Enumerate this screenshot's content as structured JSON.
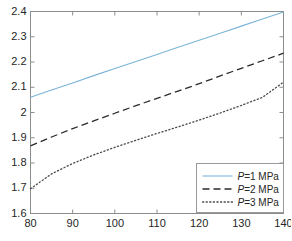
{
  "chart_data": {
    "type": "line",
    "title": "",
    "xlabel": "",
    "ylabel": "",
    "xlim": [
      80,
      140
    ],
    "ylim": [
      1.6,
      2.4
    ],
    "xticks": [
      80,
      90,
      100,
      110,
      120,
      130,
      140
    ],
    "yticks": [
      1.6,
      1.7,
      1.8,
      1.9,
      2.0,
      2.1,
      2.2,
      2.3,
      2.4
    ],
    "xtick_labels": [
      "80",
      "90",
      "100",
      "110",
      "120",
      "130",
      "140"
    ],
    "ytick_labels": [
      "1.6",
      "1.7",
      "1.8",
      "1.9",
      "2",
      "2.1",
      "2.2",
      "2.3",
      "2.4"
    ],
    "grid": false,
    "legend_position": "lower right",
    "box": true,
    "tick_direction": "in",
    "x": [
      80,
      85,
      90,
      95,
      100,
      105,
      110,
      115,
      120,
      125,
      130,
      135,
      140
    ],
    "series": [
      {
        "name": "P=1 MPa",
        "label_prefix": "P",
        "label_suffix": "=1 MPa",
        "style": "solid",
        "color": "#7ab4d8",
        "values": [
          2.06,
          2.089,
          2.117,
          2.146,
          2.174,
          2.202,
          2.23,
          2.258,
          2.286,
          2.314,
          2.342,
          2.37,
          2.398
        ]
      },
      {
        "name": "P=2 MPa",
        "label_prefix": "P",
        "label_suffix": "=2 MPa",
        "style": "dashed",
        "color": "#2b2b2b",
        "values": [
          1.868,
          1.903,
          1.936,
          1.967,
          1.997,
          2.027,
          2.056,
          2.085,
          2.114,
          2.145,
          2.175,
          2.205,
          2.235
        ]
      },
      {
        "name": "P=3 MPa",
        "label_prefix": "P",
        "label_suffix": "=3 MPa",
        "style": "dotted",
        "color": "#4a4a4a",
        "values": [
          1.698,
          1.757,
          1.798,
          1.832,
          1.862,
          1.89,
          1.917,
          1.943,
          1.97,
          1.998,
          2.028,
          2.06,
          2.12
        ]
      }
    ]
  },
  "axes": {
    "frame_color": "#8c8c8c",
    "tick_color": "#8c8c8c",
    "background": "#ffffff"
  },
  "legend": {
    "border_color": "#9a9a9a",
    "background": "#ffffff",
    "entries": [
      {
        "prefix": "P",
        "text": "=1 MPa",
        "full": "P=1 MPa"
      },
      {
        "prefix": "P",
        "text": "=2 MPa",
        "full": "P=2 MPa"
      },
      {
        "prefix": "P",
        "text": "=3 MPa",
        "full": "P=3 MPa"
      }
    ]
  }
}
